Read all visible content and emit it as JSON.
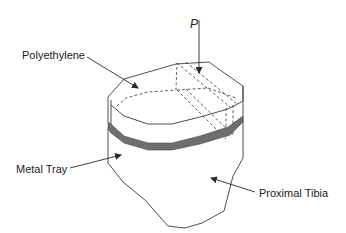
{
  "diagram": {
    "type": "schematic",
    "labels": {
      "polyethylene": "Polyethylene",
      "load": "P",
      "metal_tray": "Metal Tray",
      "proximal_tibia": "Proximal Tibia"
    },
    "components": [
      {
        "name": "Polyethylene",
        "style": "white insert with dashed hidden edges"
      },
      {
        "name": "Metal Tray",
        "style": "dark gray band"
      },
      {
        "name": "Proximal Tibia",
        "style": "outlined bone below tray"
      }
    ],
    "load_arrow": {
      "label": "P",
      "direction": "down"
    },
    "colors": {
      "line": "#3a3a3a",
      "tray": "#6e6e6e",
      "background": "#ffffff"
    }
  }
}
